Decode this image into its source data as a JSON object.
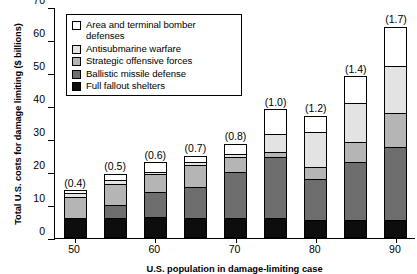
{
  "chart_data": {
    "type": "bar",
    "stacked": true,
    "title": "",
    "xlabel": "U.S. population in damage-limiting case",
    "ylabel": "Total U.S. costs  for damage limiting ($ billions)",
    "ylim": [
      0,
      70
    ],
    "ytick_labels": [
      "0",
      "10",
      "20",
      "30",
      "40",
      "50",
      "60",
      "70"
    ],
    "ytick_values": [
      0,
      10,
      20,
      30,
      40,
      50,
      60,
      70
    ],
    "grid": false,
    "legend_position": "top-center",
    "categories": [
      "50",
      "",
      "60",
      "",
      "70",
      "",
      "80",
      "",
      "90"
    ],
    "xtick_labels": [
      "50",
      "60",
      "70",
      "80",
      "90"
    ],
    "xtick_positions": [
      0,
      2,
      4,
      6,
      8
    ],
    "bar_annotations": [
      "(0.4)",
      "(0.5)",
      "(0.6)",
      "(0.7)",
      "(0.8)",
      "(1.0)",
      "(1.2)",
      "(1.4)",
      "(1.7)"
    ],
    "series": [
      {
        "name": "Full fallout shelters",
        "color": "#0d0d0d",
        "values": [
          6.0,
          6.0,
          6.5,
          6.0,
          6.0,
          6.0,
          5.5,
          5.5,
          5.5
        ]
      },
      {
        "name": "Ballistic missile defense",
        "color": "#6e6e6e",
        "values": [
          0.0,
          4.0,
          7.5,
          9.5,
          14.0,
          18.5,
          12.5,
          17.5,
          22.0
        ]
      },
      {
        "name": "Strategic offensive forces",
        "color": "#b5b5b5",
        "values": [
          6.5,
          6.5,
          5.5,
          6.5,
          4.5,
          1.5,
          3.5,
          6.0,
          10.5
        ]
      },
      {
        "name": "Antisubmarine warfare",
        "color": "#e3e3e3",
        "values": [
          1.0,
          1.0,
          0.5,
          1.0,
          1.0,
          5.5,
          10.5,
          12.0,
          14.0
        ]
      },
      {
        "name": "Area and terminal bomber defenses",
        "color": "#ffffff",
        "values": [
          1.0,
          2.0,
          3.0,
          2.0,
          3.0,
          7.5,
          5.0,
          8.0,
          12.0
        ]
      }
    ],
    "totals": [
      14.5,
      19.5,
      23.0,
      25.0,
      28.5,
      39.0,
      37.0,
      49.0,
      64.0
    ]
  },
  "legend": {
    "entries": [
      {
        "label": "Area and terminal bomber defenses",
        "color": "#ffffff"
      },
      {
        "label": "Antisubmarine warfare",
        "color": "#e3e3e3"
      },
      {
        "label": "Strategic offensive forces",
        "color": "#b5b5b5"
      },
      {
        "label": "Ballistic missile defense",
        "color": "#6e6e6e"
      },
      {
        "label": "Full fallout shelters",
        "color": "#0d0d0d"
      }
    ]
  }
}
